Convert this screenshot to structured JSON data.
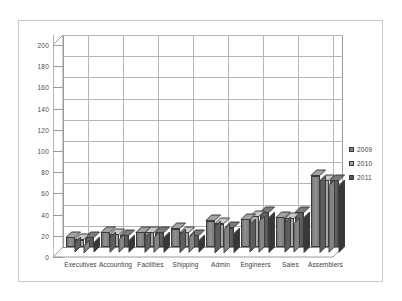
{
  "chart_data": {
    "type": "bar",
    "title": "",
    "subtitle": "",
    "xlabel": "",
    "ylabel": "",
    "ylim": [
      0,
      200
    ],
    "ytick_step": 20,
    "yticks": [
      0,
      20,
      40,
      60,
      80,
      100,
      120,
      140,
      160,
      180,
      200
    ],
    "grid": true,
    "grid_axis": "both",
    "legend_position": "right",
    "style": "3d-clustered-column",
    "categories": [
      "Executives",
      "Accounting",
      "Facilities",
      "Shipping",
      "Admin",
      "Engineers",
      "Sales",
      "Assemblers"
    ],
    "series": [
      {
        "name": "2009",
        "color": "#808080",
        "values": [
          9,
          14,
          14,
          17,
          25,
          26,
          28,
          67
        ]
      },
      {
        "name": "2010",
        "color": "#a6a6a6",
        "values": [
          7,
          12,
          14,
          14,
          22,
          29,
          27,
          63
        ]
      },
      {
        "name": "2011",
        "color": "#595959",
        "values": [
          9,
          11,
          14,
          11,
          18,
          33,
          33,
          63
        ]
      }
    ]
  },
  "legend": {
    "items": [
      {
        "label": "2009",
        "color": "#808080"
      },
      {
        "label": "2010",
        "color": "#a6a6a6"
      },
      {
        "label": "2011",
        "color": "#595959"
      }
    ]
  },
  "axis": {
    "y_labels": [
      "200",
      "180",
      "160",
      "140",
      "120",
      "100",
      "80",
      "60",
      "40",
      "20",
      "0"
    ]
  },
  "colors": {
    "frame_border": "#c9c9c9",
    "gridline": "#b5b5b5",
    "axis_line": "#9a9a9a",
    "bar_outline": "#3c3c3c",
    "text": "#3d3d3d",
    "background": "#ffffff"
  }
}
